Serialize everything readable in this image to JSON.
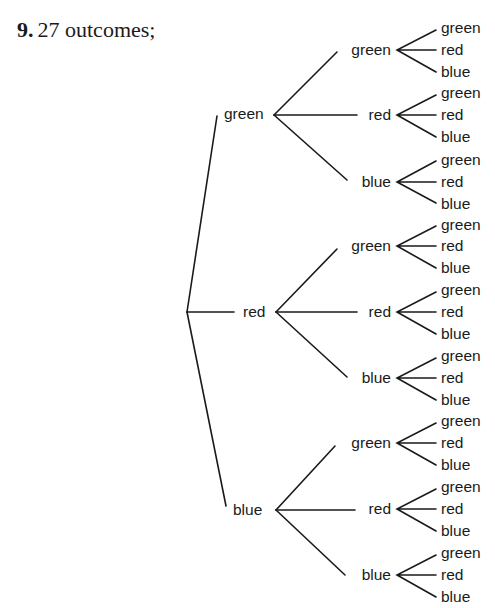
{
  "heading": {
    "number": "9.",
    "text": "27 outcomes;"
  },
  "tree": {
    "root": "",
    "level1": [
      {
        "label": "green",
        "children": [
          {
            "label": "green",
            "leaves": [
              "green",
              "red",
              "blue"
            ]
          },
          {
            "label": "red",
            "leaves": [
              "green",
              "red",
              "blue"
            ]
          },
          {
            "label": "blue",
            "leaves": [
              "green",
              "red",
              "blue"
            ]
          }
        ]
      },
      {
        "label": "red",
        "children": [
          {
            "label": "green",
            "leaves": [
              "green",
              "red",
              "blue"
            ]
          },
          {
            "label": "red",
            "leaves": [
              "green",
              "red",
              "blue"
            ]
          },
          {
            "label": "blue",
            "leaves": [
              "green",
              "red",
              "blue"
            ]
          }
        ]
      },
      {
        "label": "blue",
        "children": [
          {
            "label": "green",
            "leaves": [
              "green",
              "red",
              "blue"
            ]
          },
          {
            "label": "red",
            "leaves": [
              "green",
              "red",
              "blue"
            ]
          },
          {
            "label": "blue",
            "leaves": [
              "green",
              "red",
              "blue"
            ]
          }
        ]
      }
    ],
    "total_outcomes": 27
  },
  "colors": {
    "line": "#1a1a1a",
    "text": "#1a1a1a",
    "background": "#ffffff"
  }
}
